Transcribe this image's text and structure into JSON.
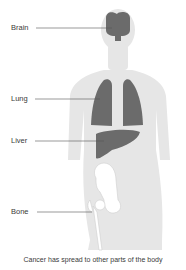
{
  "diagram": {
    "labels": [
      {
        "id": "brain",
        "text": "Brain"
      },
      {
        "id": "lung",
        "text": "Lung"
      },
      {
        "id": "liver",
        "text": "Liver"
      },
      {
        "id": "bone",
        "text": "Bone"
      }
    ],
    "caption": "Cancer has spread to other parts of the body",
    "colors": {
      "body": "#e6e6e6",
      "organ": "#6b6b6b",
      "bone": "#ffffff",
      "leader_line": "#555555",
      "text": "#3a3a3a"
    }
  }
}
